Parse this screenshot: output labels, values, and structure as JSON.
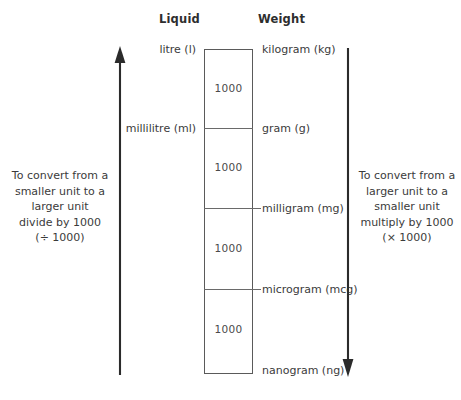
{
  "diagram": {
    "title_liquid": "Liquid",
    "title_weight": "Weight",
    "columns": {
      "liquid": {
        "header": "Liquid",
        "units": [
          {
            "label": "litre (l)"
          },
          {
            "label": "millilitre (ml)"
          }
        ]
      },
      "weight": {
        "header": "Weight",
        "units": [
          {
            "label": "kilogram (kg)"
          },
          {
            "label": "gram (g)"
          },
          {
            "label": "milligram (mg)"
          },
          {
            "label": "microgram (mcg)"
          },
          {
            "label": "nanogram (ng)"
          }
        ]
      }
    },
    "segments": [
      {
        "factor": "1000"
      },
      {
        "factor": "1000"
      },
      {
        "factor": "1000"
      },
      {
        "factor": "1000"
      }
    ],
    "left_note": {
      "line1": "To convert from a",
      "line2": "smaller unit to a",
      "line3": "larger unit",
      "line4": "divide by 1000",
      "line5": "(÷ 1000)",
      "direction": "up",
      "arrow_icon": "arrow-up-icon"
    },
    "right_note": {
      "line1": "To convert from a",
      "line2": "larger unit to a",
      "line3": "smaller unit",
      "line4": "multiply by 1000",
      "line5": "(× 1000)",
      "direction": "down",
      "arrow_icon": "arrow-down-icon"
    },
    "colors": {
      "background": "#ffffff",
      "text": "#3b3b3b",
      "heading": "#2e2e2e",
      "line": "#5a5a5a",
      "arrow": "#2b2b2b"
    }
  }
}
